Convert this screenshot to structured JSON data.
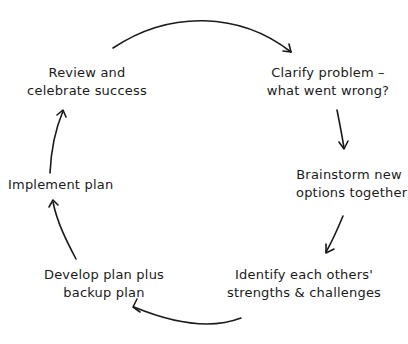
{
  "diagram": {
    "type": "cycle",
    "steps": [
      {
        "id": "clarify",
        "lines": [
          "Clarify problem –",
          "what went wrong?"
        ]
      },
      {
        "id": "brainstorm",
        "lines": [
          "Brainstorm new",
          "options together"
        ]
      },
      {
        "id": "identify",
        "lines": [
          "Identify each others'",
          "strengths & challenges"
        ]
      },
      {
        "id": "develop",
        "lines": [
          "Develop plan plus",
          "backup plan"
        ]
      },
      {
        "id": "implement",
        "lines": [
          "Implement plan"
        ]
      },
      {
        "id": "review",
        "lines": [
          "Review and",
          "celebrate success"
        ]
      }
    ],
    "edges": [
      {
        "from": "review",
        "to": "clarify"
      },
      {
        "from": "clarify",
        "to": "brainstorm"
      },
      {
        "from": "brainstorm",
        "to": "identify"
      },
      {
        "from": "identify",
        "to": "develop"
      },
      {
        "from": "develop",
        "to": "implement"
      },
      {
        "from": "implement",
        "to": "review"
      }
    ],
    "stroke_color": "#1a1a1a",
    "background": "#ffffff"
  }
}
